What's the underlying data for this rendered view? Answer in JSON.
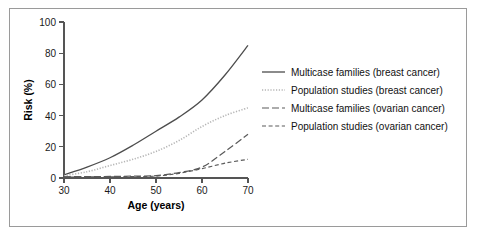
{
  "figure": {
    "border_color": "#9a9a9a",
    "background": "#ffffff"
  },
  "chart_data": {
    "type": "line",
    "title": "",
    "xlabel": "Age (years)",
    "ylabel": "Risk (%)",
    "xlim": [
      30,
      70
    ],
    "ylim": [
      0,
      100
    ],
    "xticks": [
      30,
      40,
      50,
      60,
      70
    ],
    "yticks": [
      0,
      20,
      40,
      60,
      80,
      100
    ],
    "xtick_labels": [
      "30",
      "40",
      "50",
      "60",
      "70"
    ],
    "ytick_labels": [
      "0",
      "20",
      "40",
      "60",
      "80",
      "100"
    ],
    "grid": false,
    "legend_position": "right",
    "x": [
      30,
      35,
      40,
      45,
      50,
      55,
      60,
      65,
      70
    ],
    "series": [
      {
        "name": "Multicase families (breast cancer)",
        "label": "Multicase families (breast cancer)",
        "linestyle": "solid",
        "color": "#4d4d4d",
        "dasharray": "",
        "width": 1.3,
        "values": [
          2,
          7,
          13,
          21,
          30,
          39,
          50,
          66,
          85
        ]
      },
      {
        "name": "Population studies (breast cancer)",
        "label": "Population studies (breast cancer)",
        "linestyle": "dotted",
        "color": "#b5b5b5",
        "dasharray": "1.2 1.6",
        "width": 1.6,
        "values": [
          1.5,
          4,
          8,
          12,
          17,
          24,
          33,
          40,
          45
        ]
      },
      {
        "name": "Multicase families (ovarian cancer)",
        "label": "Multicase families (ovarian cancer)",
        "linestyle": "dash-dot",
        "color": "#5a5a5a",
        "dasharray": "7 3",
        "width": 1.2,
        "values": [
          0.8,
          0.9,
          1,
          1.2,
          1.5,
          3.5,
          7,
          17,
          28
        ]
      },
      {
        "name": "Population studies (ovarian cancer)",
        "label": "Population studies (ovarian cancer)",
        "linestyle": "dashed",
        "color": "#5a5a5a",
        "dasharray": "4 2.6",
        "width": 1.2,
        "values": [
          0.6,
          0.7,
          0.8,
          0.9,
          1.2,
          3,
          6,
          9.5,
          12
        ]
      }
    ]
  }
}
